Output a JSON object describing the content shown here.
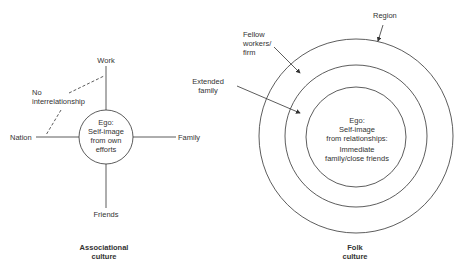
{
  "associational": {
    "title_line1": "Associational",
    "title_line2": "culture",
    "ego_line1": "Ego:",
    "ego_line2": "Self-image",
    "ego_line3": "from own",
    "ego_line4": "efforts",
    "spokes": {
      "top": "Work",
      "left": "Nation",
      "right": "Family",
      "bottom": "Friends"
    },
    "note_line1": "No",
    "note_line2": "interrelationship"
  },
  "folk": {
    "title_line1": "Folk",
    "title_line2": "culture",
    "ego_line1": "Ego:",
    "ego_line2": "Self-image",
    "ego_line3": "from relationships:",
    "ego_line4": "Immediate",
    "ego_line5": "family/close friends",
    "rings": {
      "outer": "Region",
      "middle_line1": "Fellow",
      "middle_line2": "workers/",
      "middle_line3": "firm",
      "inner_line1": "Extended",
      "inner_line2": "family"
    }
  },
  "colors": {
    "line": "#333333",
    "background": "#ffffff"
  }
}
